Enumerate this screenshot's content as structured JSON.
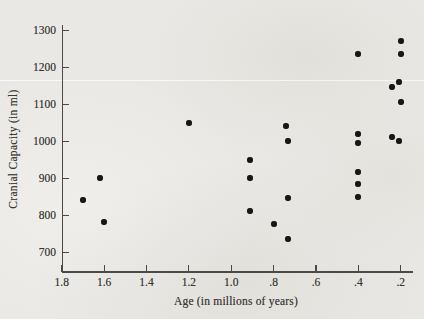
{
  "chart_data": {
    "type": "scatter",
    "title": "",
    "xlabel": "Age (in millions of years)",
    "ylabel": "Cranial Capacity (in ml)",
    "xlim": [
      1.8,
      0.2
    ],
    "ylim": [
      700,
      1300
    ],
    "x_axis_reversed": true,
    "grid": false,
    "legend": "none",
    "paper_color": "#e9e8e4",
    "axis_color": "#4b4a46",
    "point_color": "#171716",
    "x_ticks": [
      {
        "label": "1.8",
        "value": 1.8
      },
      {
        "label": "1.6",
        "value": 1.6
      },
      {
        "label": "1.4",
        "value": 1.4
      },
      {
        "label": "1.2",
        "value": 1.2
      },
      {
        "label": "1.0",
        "value": 1.0
      },
      {
        "label": ".8",
        "value": 0.8
      },
      {
        "label": ".6",
        "value": 0.6
      },
      {
        "label": ".4",
        "value": 0.4
      },
      {
        "label": ".2",
        "value": 0.2
      }
    ],
    "y_ticks": [
      {
        "label": "700",
        "value": 700
      },
      {
        "label": "800",
        "value": 800
      },
      {
        "label": "900",
        "value": 900
      },
      {
        "label": "1000",
        "value": 1000
      },
      {
        "label": "1100",
        "value": 1100
      },
      {
        "label": "1200",
        "value": 1200
      },
      {
        "label": "1300",
        "value": 1300
      }
    ],
    "points": [
      {
        "age": 1.7,
        "capacity": 840
      },
      {
        "age": 1.62,
        "capacity": 900
      },
      {
        "age": 1.6,
        "capacity": 780
      },
      {
        "age": 1.2,
        "capacity": 1050
      },
      {
        "age": 0.91,
        "capacity": 950
      },
      {
        "age": 0.91,
        "capacity": 900
      },
      {
        "age": 0.91,
        "capacity": 810
      },
      {
        "age": 0.8,
        "capacity": 775
      },
      {
        "age": 0.74,
        "capacity": 1040
      },
      {
        "age": 0.73,
        "capacity": 1000
      },
      {
        "age": 0.73,
        "capacity": 845
      },
      {
        "age": 0.73,
        "capacity": 735
      },
      {
        "age": 0.4,
        "capacity": 1235
      },
      {
        "age": 0.4,
        "capacity": 1020
      },
      {
        "age": 0.4,
        "capacity": 995
      },
      {
        "age": 0.4,
        "capacity": 915
      },
      {
        "age": 0.4,
        "capacity": 885
      },
      {
        "age": 0.4,
        "capacity": 850
      },
      {
        "age": 0.24,
        "capacity": 1145
      },
      {
        "age": 0.24,
        "capacity": 1010
      },
      {
        "age": 0.2,
        "capacity": 1270
      },
      {
        "age": 0.2,
        "capacity": 1235
      },
      {
        "age": 0.21,
        "capacity": 1160
      },
      {
        "age": 0.2,
        "capacity": 1105
      },
      {
        "age": 0.21,
        "capacity": 1000
      }
    ]
  }
}
